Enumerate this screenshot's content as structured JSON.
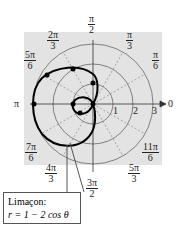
{
  "labels": {
    "a90": {
      "num": "π",
      "den": "2"
    },
    "a60": {
      "num": "π",
      "den": "3"
    },
    "a30": {
      "num": "π",
      "den": "6"
    },
    "a0": "0",
    "a120": {
      "num": "2π",
      "den": "3"
    },
    "a150": {
      "num": "5π",
      "den": "6"
    },
    "a180": "π",
    "a210": {
      "num": "7π",
      "den": "6"
    },
    "a240": {
      "num": "4π",
      "den": "3"
    },
    "a270": {
      "num": "3π",
      "den": "2"
    },
    "a300": {
      "num": "5π",
      "den": "3"
    },
    "a330": {
      "num": "11π",
      "den": "6"
    }
  },
  "radii": [
    "1",
    "2",
    "3"
  ],
  "callout": {
    "title": "Limaçon:",
    "equation": "r = 1 − 2 cos θ"
  }
}
